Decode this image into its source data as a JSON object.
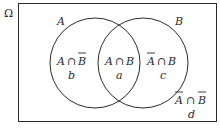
{
  "diagram": {
    "type": "venn",
    "universe_label": "Ω",
    "sets": [
      {
        "name": "A",
        "label": "A"
      },
      {
        "name": "B",
        "label": "B"
      }
    ],
    "regions": [
      {
        "id": "a_not_b",
        "expr_left": "A",
        "op": "∩",
        "expr_right": "B",
        "right_complement": true,
        "left_complement": false,
        "var": "b"
      },
      {
        "id": "a_and_b",
        "expr_left": "A",
        "op": "∩",
        "expr_right": "B",
        "right_complement": false,
        "left_complement": false,
        "var": "a"
      },
      {
        "id": "not_a_b",
        "expr_left": "A",
        "op": "∩",
        "expr_right": "B",
        "right_complement": false,
        "left_complement": true,
        "var": "c"
      },
      {
        "id": "not_a_not_b",
        "expr_left": "A",
        "op": "∩",
        "expr_right": "B",
        "right_complement": true,
        "left_complement": true,
        "var": "d"
      }
    ],
    "colors": {
      "stroke": "#2a2a2a",
      "background": "#ffffff"
    }
  }
}
